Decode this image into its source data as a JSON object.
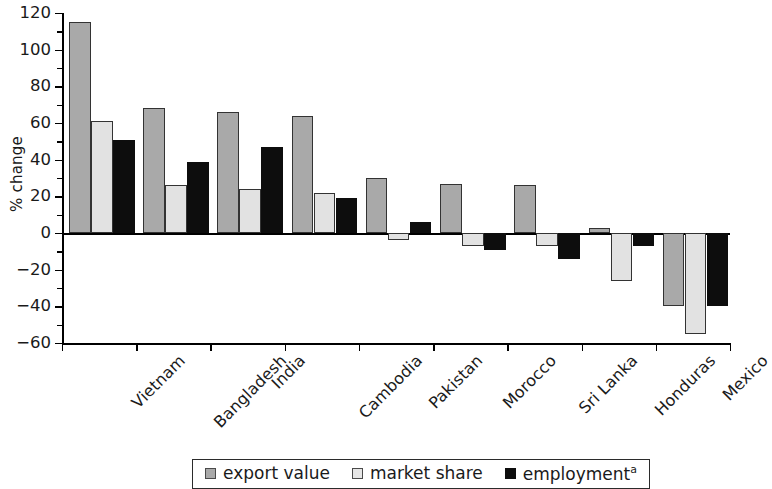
{
  "chart_data": {
    "type": "bar",
    "title": "",
    "subtitle": "",
    "xlabel": "",
    "ylabel": "% change",
    "ylim": [
      -60,
      120
    ],
    "ytick_step": 20,
    "yticks": [
      120,
      100,
      80,
      60,
      40,
      20,
      0,
      -20,
      -40,
      -60
    ],
    "ytick_labels": [
      "120",
      "100",
      "80",
      "60",
      "40",
      "20",
      "0",
      "−20",
      "−40",
      "−60"
    ],
    "grid": false,
    "legend_position": "bottom",
    "categories": [
      "Vietnam",
      "Bangladesh",
      "India",
      "Cambodia",
      "Pakistan",
      "Morocco",
      "Sri Lanka",
      "Honduras",
      "Mexico"
    ],
    "series": [
      {
        "name": "export value",
        "color": "#a9a9a9",
        "values": [
          115,
          68,
          66,
          64,
          30,
          27,
          26,
          3,
          -40
        ]
      },
      {
        "name": "market share",
        "color": "#e2e2e2",
        "values": [
          61,
          26,
          24,
          22,
          -4,
          -7,
          -7,
          -26,
          -55
        ]
      },
      {
        "name": "employment",
        "color": "#0d0d0d",
        "footnote_marker": "a",
        "values": [
          51,
          39,
          47,
          19,
          6,
          -9,
          -14,
          -7,
          -40
        ]
      }
    ]
  },
  "legend": {
    "items": [
      {
        "label": "export value",
        "marker": "square-gray-icon",
        "footnote": ""
      },
      {
        "label": "market share",
        "marker": "square-lightgray-icon",
        "footnote": ""
      },
      {
        "label": "employment",
        "marker": "square-black-icon",
        "footnote": "a"
      }
    ]
  }
}
